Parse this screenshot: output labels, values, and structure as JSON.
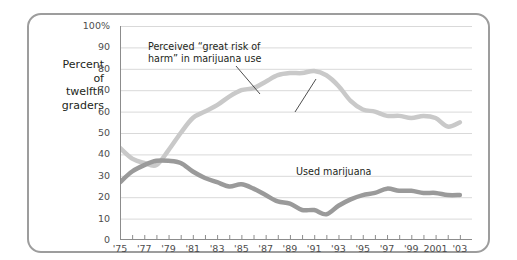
{
  "axis_caption": "Percent\nof\ntwelfth\ngraders",
  "annotations": {
    "risk": "Perceived “great risk of\nharm” in marijuana use",
    "used": "Used marijuana"
  },
  "colors": {
    "frame": "#9d9d9d",
    "grid": "#d9d9d9",
    "axis": "#8c8c8c",
    "risk_line": "#c9c9c9",
    "used_line": "#9a9a9a",
    "text": "#231f20",
    "tick_text": "#4d4d4d",
    "leader": "#3a3a3a"
  },
  "chart_data": {
    "type": "line",
    "title": "",
    "xlabel": "",
    "ylabel": "Percent of twelfth graders",
    "xlim": [
      1975,
      2004
    ],
    "ylim": [
      0,
      100
    ],
    "grid": true,
    "legend": "annotations",
    "ytick_labels": [
      "100%",
      "90",
      "80",
      "70",
      "60",
      "50",
      "40",
      "30",
      "20",
      "10",
      "0"
    ],
    "ytick_values": [
      100,
      90,
      80,
      70,
      60,
      50,
      40,
      30,
      20,
      10,
      0
    ],
    "xtick_labels": [
      "'75",
      "'77",
      "'79",
      "'81",
      "'83",
      "'85",
      "'87",
      "'89",
      "'91",
      "'93",
      "'95",
      "'97",
      "'99",
      "2001",
      "'03"
    ],
    "xtick_values": [
      1975,
      1977,
      1979,
      1981,
      1983,
      1985,
      1987,
      1989,
      1991,
      1993,
      1995,
      1997,
      1999,
      2001,
      2003
    ],
    "x": [
      1975,
      1976,
      1977,
      1978,
      1979,
      1980,
      1981,
      1982,
      1983,
      1984,
      1985,
      1986,
      1987,
      1988,
      1989,
      1990,
      1991,
      1992,
      1993,
      1994,
      1995,
      1996,
      1997,
      1998,
      1999,
      2000,
      2001,
      2002,
      2003
    ],
    "series": [
      {
        "name": "Perceived “great risk of harm” in marijuana use",
        "color": "#c9c9c9",
        "values": [
          43,
          38,
          36,
          35,
          42,
          50,
          57,
          60,
          63,
          67,
          70,
          71,
          74,
          77,
          78,
          78,
          79,
          77,
          72,
          65,
          61,
          60,
          58,
          58,
          57,
          58,
          57,
          53,
          55
        ]
      },
      {
        "name": "Used marijuana",
        "color": "#9a9a9a",
        "values": [
          27,
          32,
          35,
          37,
          37,
          36,
          32,
          29,
          27,
          25,
          26,
          24,
          21,
          18,
          17,
          14,
          14,
          12,
          16,
          19,
          21,
          22,
          24,
          23,
          23,
          22,
          22,
          21,
          21
        ]
      }
    ]
  }
}
